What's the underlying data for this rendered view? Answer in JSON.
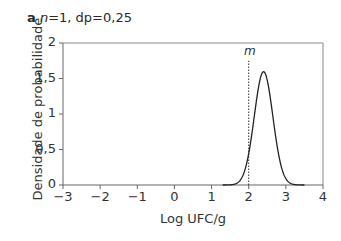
{
  "panel": {
    "letter": "a",
    "n_label": "n",
    "params_text": "=1, dp=0,25"
  },
  "chart_data": {
    "type": "line",
    "title": "a n=1, dp=0,25",
    "xlabel": "Log UFC/g",
    "ylabel": "Densidade de probabilidade",
    "xlim": [
      -3,
      4
    ],
    "ylim": [
      0,
      2
    ],
    "x_ticks": [
      -3,
      -2,
      -1,
      0,
      1,
      2,
      3,
      4
    ],
    "x_tick_labels": [
      "−3",
      "−2",
      "−1",
      "0",
      "1",
      "2",
      "3",
      "4"
    ],
    "y_ticks": [
      0,
      0.5,
      1,
      1.5,
      2
    ],
    "y_tick_labels": [
      "0",
      "0,5",
      "1",
      "1,5",
      "2"
    ],
    "grid": false,
    "series": [
      {
        "name": "Densidade (normal, média≈2,4, dp=0,25)",
        "distribution": {
          "type": "normal",
          "mean": 2.4,
          "sd": 0.25
        },
        "x": [
          1.4,
          1.6,
          1.8,
          1.9,
          2.0,
          2.1,
          2.2,
          2.3,
          2.4,
          2.5,
          2.6,
          2.7,
          2.8,
          2.9,
          3.0,
          3.2,
          3.4
        ],
        "values": [
          0.0005,
          0.0095,
          0.0888,
          0.2159,
          0.4317,
          0.7101,
          0.9656,
          1.473,
          1.5958,
          1.473,
          1.1581,
          0.7101,
          0.4317,
          0.2159,
          0.0888,
          0.0095,
          0.0005
        ],
        "color": "#222222",
        "style": "solid"
      }
    ],
    "annotations": [
      {
        "type": "vline",
        "x": 2,
        "label": "m",
        "style": "dotted",
        "y_top": 1.75
      }
    ]
  }
}
